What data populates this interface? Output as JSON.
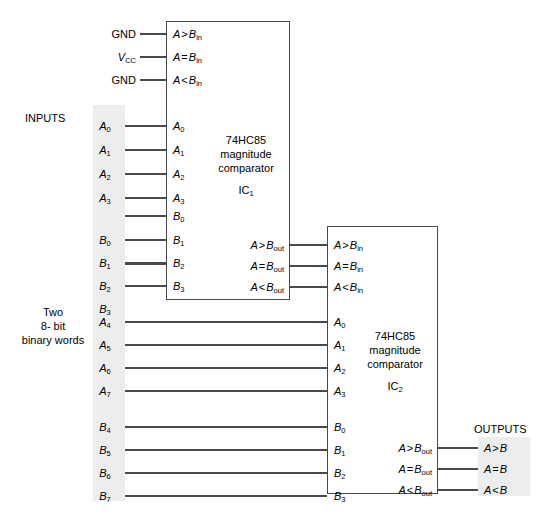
{
  "diagram": {
    "colors": {
      "line": "#444444",
      "band": "#eceded",
      "text": "#000000"
    },
    "side_labels": {
      "inputs": "INPUTS",
      "outputs": "OUTPUTS",
      "words_line1": "Two",
      "words_line2": "8- bit",
      "words_line3": "binary words"
    },
    "power_pins": [
      {
        "label": "GND",
        "pin": "A > B",
        "pin_sub": "in"
      },
      {
        "label": "V",
        "label_sub": "CC",
        "pin": "A = B",
        "pin_sub": "in"
      },
      {
        "label": "GND",
        "pin": "A < B",
        "pin_sub": "in"
      }
    ],
    "ic1": {
      "part": "74HC85",
      "function_line1": "magnitude",
      "function_line2": "comparator",
      "designator": "IC",
      "designator_sub": "1",
      "cascade_inputs": [
        {
          "text": "A > B",
          "sub": "in"
        },
        {
          "text": "A = B",
          "sub": "in"
        },
        {
          "text": "A < B",
          "sub": "in"
        }
      ],
      "data_inputs_a": [
        {
          "text": "A",
          "sub": "0"
        },
        {
          "text": "A",
          "sub": "1"
        },
        {
          "text": "A",
          "sub": "2"
        },
        {
          "text": "A",
          "sub": "3"
        }
      ],
      "data_inputs_b": [
        {
          "text": "B",
          "sub": "0"
        },
        {
          "text": "B",
          "sub": "1"
        },
        {
          "text": "B",
          "sub": "2"
        },
        {
          "text": "B",
          "sub": "3"
        }
      ],
      "outputs": [
        {
          "text": "A > B",
          "sub": "out"
        },
        {
          "text": "A = B",
          "sub": "out"
        },
        {
          "text": "A < B",
          "sub": "out"
        }
      ]
    },
    "ic2": {
      "part": "74HC85",
      "function_line1": "magnitude",
      "function_line2": "comparator",
      "designator": "IC",
      "designator_sub": "2",
      "cascade_inputs": [
        {
          "text": "A > B",
          "sub": "in"
        },
        {
          "text": "A = B",
          "sub": "in"
        },
        {
          "text": "A < B",
          "sub": "in"
        }
      ],
      "data_inputs_a": [
        {
          "text": "A",
          "sub": "0"
        },
        {
          "text": "A",
          "sub": "1"
        },
        {
          "text": "A",
          "sub": "2"
        },
        {
          "text": "A",
          "sub": "3"
        }
      ],
      "data_inputs_b": [
        {
          "text": "B",
          "sub": "0"
        },
        {
          "text": "B",
          "sub": "1"
        },
        {
          "text": "B",
          "sub": "2"
        },
        {
          "text": "B",
          "sub": "3"
        }
      ],
      "outputs": [
        {
          "text": "A > B",
          "sub": "out"
        },
        {
          "text": "A = B",
          "sub": "out"
        },
        {
          "text": "A < B",
          "sub": "out"
        }
      ]
    },
    "input_bus_upper_a": [
      {
        "text": "A",
        "sub": "0"
      },
      {
        "text": "A",
        "sub": "1"
      },
      {
        "text": "A",
        "sub": "2"
      },
      {
        "text": "A",
        "sub": "3"
      }
    ],
    "input_bus_upper_b": [
      {
        "text": "B",
        "sub": "0"
      },
      {
        "text": "B",
        "sub": "1"
      },
      {
        "text": "B",
        "sub": "2"
      },
      {
        "text": "B",
        "sub": "3"
      }
    ],
    "input_bus_lower_a": [
      {
        "text": "A",
        "sub": "4"
      },
      {
        "text": "A",
        "sub": "5"
      },
      {
        "text": "A",
        "sub": "6"
      },
      {
        "text": "A",
        "sub": "7"
      }
    ],
    "input_bus_lower_b": [
      {
        "text": "B",
        "sub": "4"
      },
      {
        "text": "B",
        "sub": "5"
      },
      {
        "text": "B",
        "sub": "6"
      },
      {
        "text": "B",
        "sub": "7"
      }
    ],
    "final_outputs": [
      {
        "text": "A > B"
      },
      {
        "text": "A = B"
      },
      {
        "text": "A < B"
      }
    ]
  }
}
